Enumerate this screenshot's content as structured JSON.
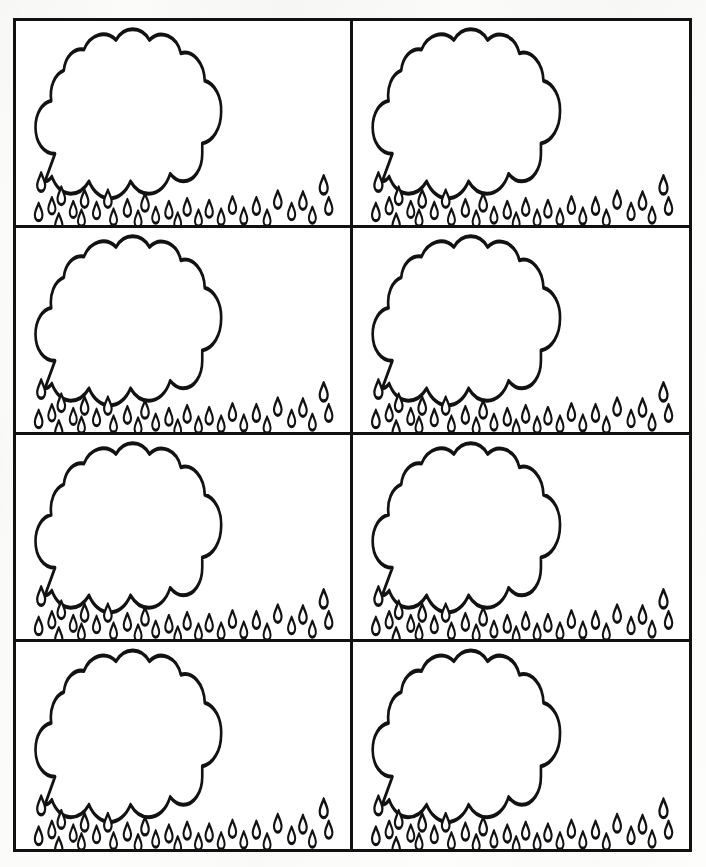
{
  "document": {
    "title": "Rain Cloud Printable Template",
    "kind": "printable-worksheet",
    "page_width": 706,
    "page_height": 867,
    "background_color": "#fdfdfc",
    "ink_color": "#121212",
    "fill_color": "#ffffff"
  },
  "grid": {
    "columns": 2,
    "rows": 4,
    "cell_count": 8,
    "border_width_px": 3,
    "outer_left": 13,
    "outer_top": 18,
    "outer_right": 692,
    "outer_bottom": 852,
    "column_divider_x": 353,
    "row_divider_y": [
      222,
      430,
      638
    ]
  },
  "card_template": {
    "name": "rain-cloud-card",
    "graphic_name": "cloud-with-raindrops",
    "cloud": {
      "name": "cloud-outline",
      "fill": "#ffffff",
      "stroke": "#121212",
      "stroke_width": 4.2,
      "bumps_top": 4,
      "bumps_bottom": 4,
      "blank_interior": true
    },
    "raindrops": {
      "name": "raindrop",
      "count": 31,
      "shape": "teardrop",
      "fill": "#ffffff",
      "stroke": "#121212",
      "stroke_width": 3.6,
      "rows": 3
    }
  },
  "cards": [
    {
      "id": "card-1",
      "row": 1,
      "column": 1,
      "position_label": "row 1 left"
    },
    {
      "id": "card-2",
      "row": 1,
      "column": 2,
      "position_label": "row 1 right"
    },
    {
      "id": "card-3",
      "row": 2,
      "column": 1,
      "position_label": "row 2 left"
    },
    {
      "id": "card-4",
      "row": 2,
      "column": 2,
      "position_label": "row 2 right"
    },
    {
      "id": "card-5",
      "row": 3,
      "column": 1,
      "position_label": "row 3 left"
    },
    {
      "id": "card-6",
      "row": 3,
      "column": 2,
      "position_label": "row 3 right"
    },
    {
      "id": "card-7",
      "row": 4,
      "column": 1,
      "position_label": "row 4 left"
    },
    {
      "id": "card-8",
      "row": 4,
      "column": 2,
      "position_label": "row 4 right"
    }
  ],
  "cloud_path": "M 62 118 C 44 118 31 106 31 90 C 31 75 42 64 56 62 C 53 48 61 34 76 30 C 78 16 92 6 108 8 C 118 -8 142 -13 159 -2 C 172 -17 199 -17 212 -2 C 230 -14 256 -6 262 12 C 281 8 299 22 300 41 C 316 44 327 58 326 74 C 326 91 313 105 296 107 L 296 118 C 296 134 283 147 266 147 C 258 147 251 144 245 139 C 239 152 226 160 211 160 C 199 160 189 155 182 147 C 175 158 163 165 149 165 C 135 165 123 158 116 147 C 109 155 99 160 87 160 C 74 160 63 153 57 142 C 54 145 50 147 46 147 L 62 118 Z",
  "raindrop_path": "M 0 0 C 2.6 5.0 6.3 9.0 6.3 13.0 C 6.3 16.6 3.5 19.4 0 19.4 C -3.5 19.4 -6.3 16.6 -6.3 13.0 C -6.3 9.0 -2.6 5.0 0 0 Z",
  "raindrop_positions": [
    {
      "x": 40,
      "y": 160,
      "scale": 1.0
    },
    {
      "x": 72,
      "y": 175,
      "scale": 0.95
    },
    {
      "x": 57,
      "y": 186,
      "scale": 0.9
    },
    {
      "x": 36,
      "y": 192,
      "scale": 0.95
    },
    {
      "x": 91,
      "y": 190,
      "scale": 0.88
    },
    {
      "x": 68,
      "y": 203,
      "scale": 0.92
    },
    {
      "x": 109,
      "y": 178,
      "scale": 0.95
    },
    {
      "x": 104,
      "y": 199,
      "scale": 0.88
    },
    {
      "x": 128,
      "y": 191,
      "scale": 0.9
    },
    {
      "x": 146,
      "y": 178,
      "scale": 0.95
    },
    {
      "x": 155,
      "y": 198,
      "scale": 0.88
    },
    {
      "x": 177,
      "y": 188,
      "scale": 0.92
    },
    {
      "x": 194,
      "y": 200,
      "scale": 0.88
    },
    {
      "x": 205,
      "y": 182,
      "scale": 0.95
    },
    {
      "x": 222,
      "y": 196,
      "scale": 0.88
    },
    {
      "x": 243,
      "y": 190,
      "scale": 0.92
    },
    {
      "x": 257,
      "y": 202,
      "scale": 0.86
    },
    {
      "x": 272,
      "y": 187,
      "scale": 0.92
    },
    {
      "x": 290,
      "y": 199,
      "scale": 0.88
    },
    {
      "x": 307,
      "y": 189,
      "scale": 0.92
    },
    {
      "x": 326,
      "y": 198,
      "scale": 0.88
    },
    {
      "x": 344,
      "y": 185,
      "scale": 0.92
    },
    {
      "x": 362,
      "y": 197,
      "scale": 0.88
    },
    {
      "x": 382,
      "y": 186,
      "scale": 0.92
    },
    {
      "x": 399,
      "y": 199,
      "scale": 0.88
    },
    {
      "x": 416,
      "y": 179,
      "scale": 0.95
    },
    {
      "x": 438,
      "y": 192,
      "scale": 0.9
    },
    {
      "x": 456,
      "y": 180,
      "scale": 0.95
    },
    {
      "x": 471,
      "y": 196,
      "scale": 0.88
    },
    {
      "x": 489,
      "y": 163,
      "scale": 1.0
    },
    {
      "x": 497,
      "y": 186,
      "scale": 0.92
    }
  ]
}
